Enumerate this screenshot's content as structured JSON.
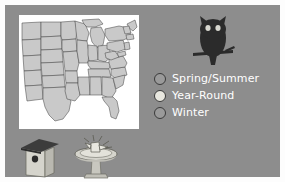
{
  "figure": {
    "background_color": "#8d8d8d",
    "frame_color": "#fdfdfd",
    "map_background": "#ffffff",
    "map_range_fill": "#c9c9c9",
    "map_outline_color": "#4a4a4a"
  },
  "legend": {
    "items": [
      {
        "label": "Spring/Summer",
        "swatch_color": "#9a9a9a",
        "outline_color": "#3a3a3a"
      },
      {
        "label": "Year-Round",
        "swatch_color": "#e8e7df",
        "outline_color": "#3a3a3a"
      },
      {
        "label": "Winter",
        "swatch_color": "#9a9a9a",
        "outline_color": "#3a3a3a"
      }
    ],
    "text_color": "#ffffff"
  },
  "icons": {
    "owl": {
      "name": "owl-icon",
      "body_color": "#2b2b2b",
      "eye_color": "#d8d8d0",
      "perch_color": "#2b2b2b"
    },
    "birdhouse": {
      "name": "birdhouse-icon",
      "roof_color": "#3c3c3c",
      "body_color": "#d5d4cc",
      "hole_color": "#2b2b2b"
    },
    "birdbath": {
      "name": "birdbath-icon",
      "basin_color": "#d5d4cc",
      "pedestal_color": "#c8c7bf",
      "bird_color": "#e8e7df",
      "outline_color": "#4a4a4a"
    }
  }
}
